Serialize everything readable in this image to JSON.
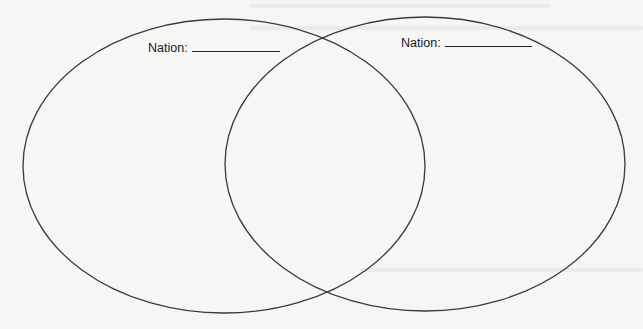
{
  "diagram": {
    "type": "venn",
    "circles": [
      {
        "id": "left",
        "label": "Nation:",
        "blank_width": 105,
        "cx": 224,
        "cy": 166,
        "rx": 201,
        "ry": 147
      },
      {
        "id": "right",
        "label": "Nation:",
        "blank_width": 103,
        "cx": 425,
        "cy": 164,
        "rx": 200,
        "ry": 147
      }
    ],
    "stroke_color": "#3a3a3a",
    "background_color": "#f6f6f5"
  }
}
